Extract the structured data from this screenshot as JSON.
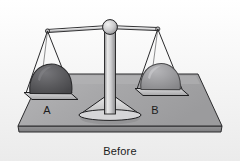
{
  "illustration": {
    "title": "Balance scale with two rocks",
    "caption": "Before",
    "background_color": "#fdfdfd",
    "pans": [
      {
        "id": "A",
        "label": "A",
        "side": "left",
        "object": "rock",
        "object_color": "#58585a",
        "object_shade_color": "#6e6e70",
        "object_outline_color": "#2a2a2c",
        "position": "lowered"
      },
      {
        "id": "B",
        "label": "B",
        "side": "right",
        "object": "rock",
        "object_color": "#9a9a9c",
        "object_shade_color": "#adadb0",
        "object_outline_color": "#4a4a4c",
        "position": "raised"
      }
    ],
    "parts": {
      "beam_label": "balance beam",
      "pivot_label": "pivot ball",
      "post_label": "center post",
      "base_label": "base foot",
      "platform_label": "table platform"
    },
    "colors": {
      "platform_top": "#a9a9ab",
      "platform_front": "#8e8e90",
      "platform_outline": "#2b2b2d",
      "metal_light": "#e6e6e6",
      "metal_mid": "#bdbdbd",
      "metal_dark": "#7d7d7f",
      "outline": "#1f1f21",
      "string": "#2a2a2c",
      "text": "#1c1c1c"
    }
  }
}
